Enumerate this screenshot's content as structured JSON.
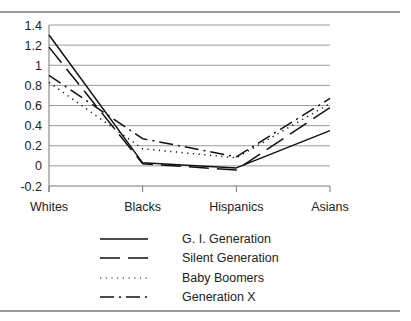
{
  "chart_data": {
    "type": "line",
    "title": "",
    "xlabel": "",
    "ylabel": "",
    "categories": [
      "Whites",
      "Blacks",
      "Hispanics",
      "Asians"
    ],
    "ylim": [
      -0.2,
      1.4
    ],
    "yticks": [
      "1.4",
      "1.2",
      "1",
      "0.8",
      "0.6",
      "0.4",
      "0.2",
      "0",
      "-0.2"
    ],
    "grid": true,
    "legend_position": "bottom",
    "series": [
      {
        "name": "G. I. Generation",
        "dash": "solid",
        "values": [
          1.3,
          0.03,
          -0.02,
          0.35
        ]
      },
      {
        "name": "Silent Generation",
        "dash": "long-dash",
        "values": [
          1.18,
          0.02,
          -0.04,
          0.58
        ]
      },
      {
        "name": "Baby Boomers",
        "dash": "dotted",
        "values": [
          0.83,
          0.17,
          0.08,
          0.62
        ]
      },
      {
        "name": "Generation X",
        "dash": "dash-dot",
        "values": [
          0.9,
          0.27,
          0.09,
          0.67
        ]
      }
    ]
  },
  "legend": {
    "items": [
      "G. I. Generation",
      "Silent Generation",
      "Baby Boomers",
      "Generation X"
    ]
  },
  "colors": {
    "line": "#111111",
    "grid": "#9a9a9a",
    "rule": "#9a9a9a"
  }
}
